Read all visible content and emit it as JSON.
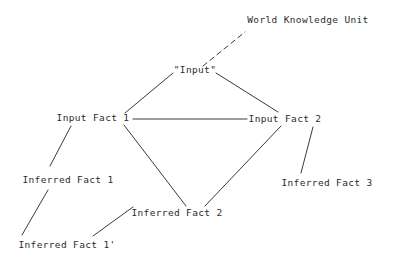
{
  "diagram": {
    "type": "node-link-graph",
    "canvas": {
      "width": 394,
      "height": 262
    },
    "style": {
      "background_color": "#ffffff",
      "line_color": "#3a3a3a",
      "text_color": "#2b2b2b",
      "line_width": 1,
      "dash_pattern": "5 4"
    },
    "nodes": [
      {
        "id": "world-knowledge-unit",
        "label": "World Knowledge Unit",
        "cx": 308,
        "cy": 20
      },
      {
        "id": "input",
        "label": "\"Input\"",
        "cx": 195,
        "cy": 70
      },
      {
        "id": "input-fact-1",
        "label": "Input Fact 1",
        "cx": 93,
        "cy": 118
      },
      {
        "id": "input-fact-2",
        "label": "Input Fact 2",
        "cx": 285,
        "cy": 119
      },
      {
        "id": "inferred-fact-1",
        "label": "Inferred Fact 1",
        "cx": 68,
        "cy": 180
      },
      {
        "id": "inferred-fact-3",
        "label": "Inferred Fact 3",
        "cx": 327,
        "cy": 183
      },
      {
        "id": "inferred-fact-2",
        "label": "Inferred Fact 2",
        "cx": 177,
        "cy": 213
      },
      {
        "id": "inferred-fact-1-prime",
        "label": "Inferred Fact 1'",
        "cx": 67,
        "cy": 245
      }
    ],
    "edges": [
      {
        "id": "edge-input-to-world-knowledge-unit",
        "from": "input",
        "to": "world-knowledge-unit",
        "x1": 203,
        "y1": 66,
        "x2": 245,
        "y2": 32,
        "dashed": true
      },
      {
        "id": "edge-input-to-input-fact-1",
        "from": "input",
        "to": "input-fact-1",
        "x1": 173,
        "y1": 73,
        "x2": 125,
        "y2": 113,
        "dashed": false
      },
      {
        "id": "edge-input-to-input-fact-2",
        "from": "input",
        "to": "input-fact-2",
        "x1": 216,
        "y1": 73,
        "x2": 278,
        "y2": 112,
        "dashed": false
      },
      {
        "id": "edge-input-fact-1-to-input-fact-2",
        "from": "input-fact-1",
        "to": "input-fact-2",
        "x1": 133,
        "y1": 119,
        "x2": 247,
        "y2": 119,
        "dashed": false
      },
      {
        "id": "edge-input-fact-1-to-inferred-fact-1",
        "from": "input-fact-1",
        "to": "inferred-fact-1",
        "x1": 71,
        "y1": 126,
        "x2": 50,
        "y2": 166,
        "dashed": false
      },
      {
        "id": "edge-input-fact-1-to-inferred-fact-2",
        "from": "input-fact-1",
        "to": "inferred-fact-2",
        "x1": 124,
        "y1": 125,
        "x2": 186,
        "y2": 206,
        "dashed": false
      },
      {
        "id": "edge-input-fact-2-to-inferred-fact-2",
        "from": "input-fact-2",
        "to": "inferred-fact-2",
        "x1": 281,
        "y1": 126,
        "x2": 205,
        "y2": 206,
        "dashed": false
      },
      {
        "id": "edge-input-fact-2-to-inferred-fact-3",
        "from": "input-fact-2",
        "to": "inferred-fact-3",
        "x1": 313,
        "y1": 127,
        "x2": 301,
        "y2": 173,
        "dashed": false
      },
      {
        "id": "edge-inferred-fact-1-to-inferred-fact-1-prime",
        "from": "inferred-fact-1",
        "to": "inferred-fact-1-prime",
        "x1": 48,
        "y1": 190,
        "x2": 22,
        "y2": 235,
        "dashed": false
      },
      {
        "id": "edge-inferred-fact-1-prime-to-inferred-fact-2",
        "from": "inferred-fact-1-prime",
        "to": "inferred-fact-2",
        "x1": 93,
        "y1": 236,
        "x2": 133,
        "y2": 207,
        "dashed": false
      }
    ]
  }
}
